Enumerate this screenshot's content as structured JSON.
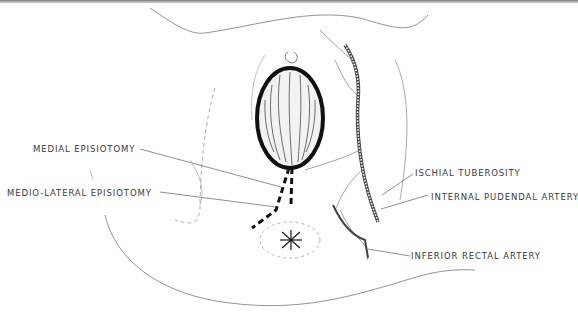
{
  "figure": {
    "labels": {
      "medial_episiotomy": "MEDIAL EPISIOTOMY",
      "medio_lateral_episiotomy": "MEDIO-LATERAL EPISIOTOMY",
      "ischial_tuberosity": "ISCHIAL TUBEROSITY",
      "internal_pudendal_artery": "INTERNAL PUDENDAL ARTERY",
      "inferior_rectal_artery": "INFERIOR RECTAL ARTERY"
    },
    "colors": {
      "ink": "#1a1a1a",
      "line": "#555555",
      "background": "#ffffff"
    }
  }
}
